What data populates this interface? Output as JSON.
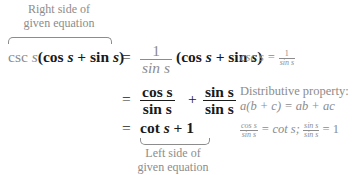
{
  "top_label": {
    "line1": "Right side of",
    "line2": "given equation"
  },
  "bottom_label": {
    "line1": "Left side of",
    "line2": "given equation"
  },
  "line1": {
    "lhs_gray": "csc ",
    "lhs_var": "s",
    "lhs_rest_open": "(cos ",
    "lhs_var2": "s",
    "lhs_plus": " + sin ",
    "lhs_var3": "s",
    "lhs_close": ")",
    "equals": "=",
    "frac_num": "1",
    "frac_den": "sin s",
    "rhs_open": "(cos ",
    "rhs_var": "s",
    "rhs_plus": " + sin ",
    "rhs_var2": "s",
    "rhs_close": ")"
  },
  "line2": {
    "equals": "=",
    "frac1_num": "cos s",
    "frac1_den": "sin s",
    "plus": "+",
    "frac2_num": "sin s",
    "frac2_den": "sin s"
  },
  "line3": {
    "equals": "=",
    "expr_cot": "cot ",
    "expr_var": "s",
    "expr_rest": " + 1"
  },
  "notes": {
    "note1_lhs": "csc s = ",
    "note1_num": "1",
    "note1_den": "sin s",
    "note2_line1": "Distributive property:",
    "note2_line2": "a(b + c) = ab + ac",
    "note3_num1": "cos s",
    "note3_den1": "sin s",
    "note3_mid": " = cot s; ",
    "note3_num2": "sin s",
    "note3_den2": "sin s",
    "note3_end": " = 1"
  }
}
